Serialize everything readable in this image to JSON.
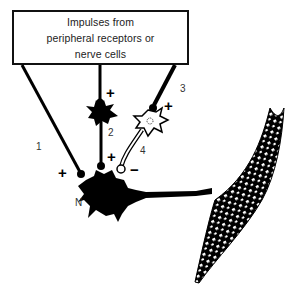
{
  "source_box": {
    "lines": [
      "Impulses from",
      "peripheral receptors or",
      "nerve cells"
    ]
  },
  "labels": {
    "pathway_1": "1",
    "pathway_2": "2",
    "pathway_3": "3",
    "pathway_4": "4",
    "neuron": "N"
  },
  "signs": {
    "pathway_1": "+",
    "pathway_2_upper": "+",
    "pathway_2_lower": "+",
    "pathway_3": "+",
    "pathway_4": "−"
  },
  "elements": {
    "excitatory_interneuron": "black neuron (pathway 2)",
    "inhibitory_interneuron": "white neuron (pathway 3 to 4)",
    "motor_neuron": "N",
    "muscle_fiber": "striated muscle fiber"
  },
  "colors": {
    "ink": "#000000",
    "background": "#ffffff"
  }
}
